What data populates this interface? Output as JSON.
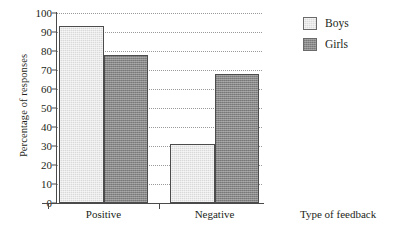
{
  "chart_data": {
    "type": "bar",
    "title": "",
    "subtitle": "",
    "xlabel": "Type of feedback",
    "ylabel": "Percentage of responses",
    "categories": [
      "Positive",
      "Negative"
    ],
    "series": [
      {
        "name": "Boys",
        "values": [
          93,
          31
        ],
        "color": "#d9d9d9"
      },
      {
        "name": "Girls",
        "values": [
          78,
          68
        ],
        "color": "#888888"
      }
    ],
    "ylim": [
      0,
      100
    ],
    "yticks": [
      0,
      10,
      20,
      30,
      40,
      50,
      60,
      70,
      80,
      90,
      100
    ],
    "ytick_labels": [
      "0",
      "10",
      "20",
      "30",
      "40",
      "50",
      "60",
      "70",
      "80",
      "90",
      "100"
    ],
    "grid": true,
    "grid_style": "dotted",
    "grid_axis": "y",
    "legend_position": "top-right",
    "legend_entries": [
      "Boys",
      "Girls"
    ],
    "bar_grouping": "grouped",
    "annotations": []
  },
  "legend": {
    "items": [
      {
        "label": "Boys"
      },
      {
        "label": "Girls"
      }
    ]
  },
  "axes": {
    "y_title": "Percentage of responses",
    "x_title": "Type of feedback"
  }
}
